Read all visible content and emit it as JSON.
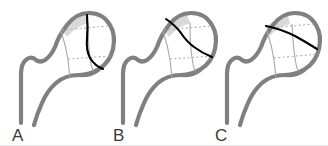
{
  "figure": {
    "width": 328,
    "height": 146,
    "background_color": "#ffffff",
    "panel_count": 3
  },
  "style": {
    "outline_color": "#808080",
    "outline_width": 4.2,
    "wedge_fill_color": "#d9d9d9",
    "neck_line_color": "#a8a8a8",
    "dotted_line_color": "#b4aeb0",
    "fracture_line_color": "#000000",
    "label_color": "#3b3b3b",
    "bone_fill_color": "#ffffff"
  },
  "panels": [
    {
      "id": "a",
      "label": "A",
      "label_x": 12,
      "label_y": 140,
      "offset_x": 0,
      "fracture_orientation": "vertical",
      "fracture_description": "Steep near-vertical fracture line through femoral head",
      "wedge_description": "Light gray wedge at superior femoral head",
      "anatomy": [
        "femoral shaft",
        "greater trochanter",
        "femoral neck",
        "femoral head"
      ]
    },
    {
      "id": "b",
      "label": "B",
      "label_x": 113,
      "label_y": 140,
      "offset_x": 102,
      "fracture_orientation": "oblique",
      "fracture_description": "Oblique fracture line descending across femoral head",
      "wedge_description": "Light gray wedge at superior femoral head",
      "anatomy": [
        "femoral shaft",
        "greater trochanter",
        "femoral neck",
        "femoral head"
      ]
    },
    {
      "id": "c",
      "label": "C",
      "label_x": 215,
      "label_y": 140,
      "offset_x": 206,
      "fracture_orientation": "horizontal",
      "fracture_description": "Near-horizontal fracture line across femoral head",
      "wedge_description": "Light gray wedge at superior femoral head",
      "anatomy": [
        "femoral shaft",
        "greater trochanter",
        "femoral neck",
        "femoral head"
      ]
    }
  ]
}
